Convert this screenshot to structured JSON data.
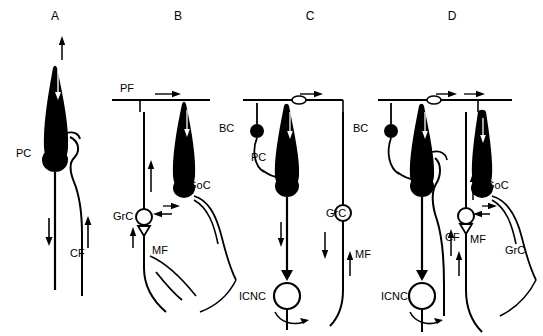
{
  "figure": {
    "title": "",
    "background": "#ffffff",
    "ink": "#000000",
    "panels": [
      {
        "id": "A",
        "label": "A",
        "label_x": 55,
        "label_y": 20,
        "labels": [
          {
            "name": "purkinje-cell-label",
            "text": "PC",
            "x": 16,
            "y": 157
          },
          {
            "name": "climbing-fiber-label",
            "text": "CF",
            "x": 70,
            "y": 257
          }
        ]
      },
      {
        "id": "B",
        "label": "B",
        "label_x": 178,
        "label_y": 20,
        "labels": [
          {
            "name": "parallel-fiber-label",
            "text": "PF",
            "x": 120,
            "y": 92
          },
          {
            "name": "golgi-cell-label",
            "text": "GoC",
            "x": 188,
            "y": 189
          },
          {
            "name": "granule-cell-label",
            "text": "GrC",
            "x": 117,
            "y": 216
          },
          {
            "name": "mossy-fiber-label",
            "text": "MF",
            "x": 152,
            "y": 251
          }
        ]
      },
      {
        "id": "C",
        "label": "C",
        "label_x": 310,
        "label_y": 20,
        "labels": [
          {
            "name": "basket-cell-label",
            "text": "BC",
            "x": 221,
            "y": 132
          },
          {
            "name": "purkinje-cell-label",
            "text": "PC",
            "x": 253,
            "y": 161
          },
          {
            "name": "granule-cell-label",
            "text": "GrC",
            "x": 329,
            "y": 216
          },
          {
            "name": "mossy-fiber-label",
            "text": "MF",
            "x": 355,
            "y": 256
          },
          {
            "name": "icnc-label",
            "text": "ICNC",
            "x": 243,
            "y": 299
          }
        ]
      },
      {
        "id": "D",
        "label": "D",
        "label_x": 452,
        "label_y": 20,
        "labels": [
          {
            "name": "basket-cell-label",
            "text": "BC",
            "x": 355,
            "y": 132
          },
          {
            "name": "golgi-cell-label",
            "text": "GoC",
            "x": 487,
            "y": 189
          },
          {
            "name": "climbing-fiber-label",
            "text": "CF",
            "x": 447,
            "y": 239
          },
          {
            "name": "mossy-fiber-label",
            "text": "MF",
            "x": 472,
            "y": 241
          },
          {
            "name": "granule-cell-label",
            "text": "GrC",
            "x": 508,
            "y": 252
          },
          {
            "name": "icnc-label",
            "text": "ICNC",
            "x": 385,
            "y": 299
          }
        ]
      }
    ]
  }
}
